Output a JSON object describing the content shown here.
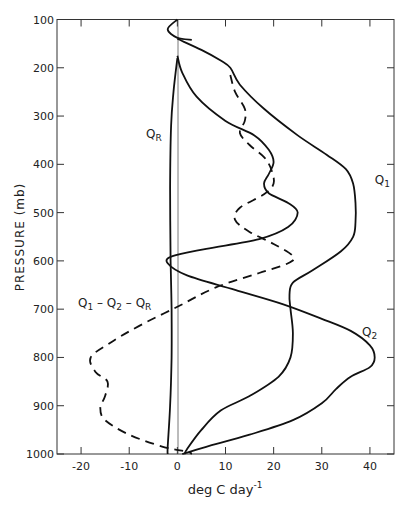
{
  "chart_data": {
    "type": "line",
    "title": "",
    "xlabel": "deg C day^-1",
    "xlabel_base": "deg C day",
    "xlabel_sup": "-1",
    "ylabel": "PRESSURE (mb)",
    "xlim": [
      -25,
      45
    ],
    "ylim": [
      1000,
      100
    ],
    "y_inverted": true,
    "grid": false,
    "x_ticks": [
      -20,
      -10,
      0,
      10,
      20,
      30,
      40
    ],
    "y_ticks": [
      100,
      200,
      300,
      400,
      500,
      600,
      700,
      800,
      900,
      1000
    ],
    "x_tick_labels": [
      "-20",
      "-10",
      "0",
      "10",
      "20",
      "30",
      "40"
    ],
    "y_tick_labels": [
      "100",
      "200",
      "300",
      "400",
      "500",
      "600",
      "700",
      "800",
      "900",
      "1000"
    ],
    "legend": "inline labels",
    "series": [
      {
        "name": "Q1",
        "label": "Q",
        "label_sub": "1",
        "style": "solid",
        "points": [
          [
            0,
            140
          ],
          [
            5,
            163
          ],
          [
            9,
            185
          ],
          [
            11,
            200
          ],
          [
            13,
            235
          ],
          [
            18,
            285
          ],
          [
            25,
            340
          ],
          [
            31,
            380
          ],
          [
            35,
            410
          ],
          [
            36.5,
            440
          ],
          [
            37,
            480
          ],
          [
            37,
            520
          ],
          [
            36.5,
            550
          ],
          [
            34,
            580
          ],
          [
            28,
            620
          ],
          [
            24,
            645
          ],
          [
            23.3,
            670
          ],
          [
            23.5,
            700
          ],
          [
            24,
            750
          ],
          [
            23.5,
            800
          ],
          [
            21,
            840
          ],
          [
            15,
            880
          ],
          [
            9,
            910
          ],
          [
            5,
            950
          ],
          [
            2,
            990
          ],
          [
            1.5,
            1000
          ]
        ]
      },
      {
        "name": "Q2",
        "label": "Q",
        "label_sub": "2",
        "style": "solid",
        "points": [
          [
            0,
            175
          ],
          [
            1,
            210
          ],
          [
            4,
            260
          ],
          [
            10,
            310
          ],
          [
            16,
            340
          ],
          [
            19,
            370
          ],
          [
            20,
            395
          ],
          [
            19,
            420
          ],
          [
            18,
            440
          ],
          [
            19,
            460
          ],
          [
            23,
            480
          ],
          [
            25,
            500
          ],
          [
            23,
            530
          ],
          [
            17,
            555
          ],
          [
            6,
            575
          ],
          [
            -1,
            590
          ],
          [
            -2,
            605
          ],
          [
            2,
            630
          ],
          [
            12,
            660
          ],
          [
            22,
            690
          ],
          [
            30,
            720
          ],
          [
            36,
            745
          ],
          [
            40,
            775
          ],
          [
            41,
            800
          ],
          [
            40,
            820
          ],
          [
            36,
            840
          ],
          [
            33,
            865
          ],
          [
            30,
            895
          ],
          [
            24,
            930
          ],
          [
            15,
            960
          ],
          [
            6,
            985
          ],
          [
            2,
            997
          ],
          [
            1,
            1000
          ]
        ]
      },
      {
        "name": "QR",
        "label": "Q",
        "label_sub": "R",
        "style": "solid",
        "points": [
          [
            0,
            180
          ],
          [
            -0.8,
            250
          ],
          [
            -1.3,
            320
          ],
          [
            -1.5,
            450
          ],
          [
            -1.4,
            600
          ],
          [
            -1.2,
            700
          ],
          [
            -1.2,
            800
          ],
          [
            -1.5,
            900
          ],
          [
            -2,
            985
          ],
          [
            -2,
            1000
          ]
        ]
      },
      {
        "name": "Q1 - Q2 - QR",
        "label": "Q1 - Q2 - QR",
        "style": "dashed",
        "points": [
          [
            11,
            215
          ],
          [
            12,
            250
          ],
          [
            14,
            285
          ],
          [
            14,
            310
          ],
          [
            13,
            335
          ],
          [
            15,
            360
          ],
          [
            18,
            385
          ],
          [
            19.5,
            410
          ],
          [
            20,
            440
          ],
          [
            18,
            462
          ],
          [
            13,
            490
          ],
          [
            12,
            515
          ],
          [
            15,
            540
          ],
          [
            20,
            565
          ],
          [
            24,
            590
          ],
          [
            23,
            605
          ],
          [
            17,
            625
          ],
          [
            8,
            655
          ],
          [
            0,
            695
          ],
          [
            -8,
            735
          ],
          [
            -14,
            770
          ],
          [
            -18,
            800
          ],
          [
            -17,
            830
          ],
          [
            -14.5,
            850
          ],
          [
            -15,
            880
          ],
          [
            -16,
            905
          ],
          [
            -15,
            930
          ],
          [
            -10,
            960
          ],
          [
            -3,
            985
          ],
          [
            2,
            995
          ],
          [
            3,
            1000
          ]
        ]
      },
      {
        "name": "top-loop",
        "style": "solid",
        "points": [
          [
            0,
            100
          ],
          [
            -2,
            120
          ],
          [
            0,
            138
          ],
          [
            3,
            142
          ]
        ]
      }
    ],
    "annotations": [
      {
        "text": "QR",
        "x": -6.5,
        "y": 345
      },
      {
        "text": "Q1",
        "x": 41,
        "y": 440
      },
      {
        "text": "Q2",
        "x": 40,
        "y": 755
      },
      {
        "text": "Q1 - Q2 - QR",
        "x": -17,
        "y": 700
      }
    ]
  }
}
